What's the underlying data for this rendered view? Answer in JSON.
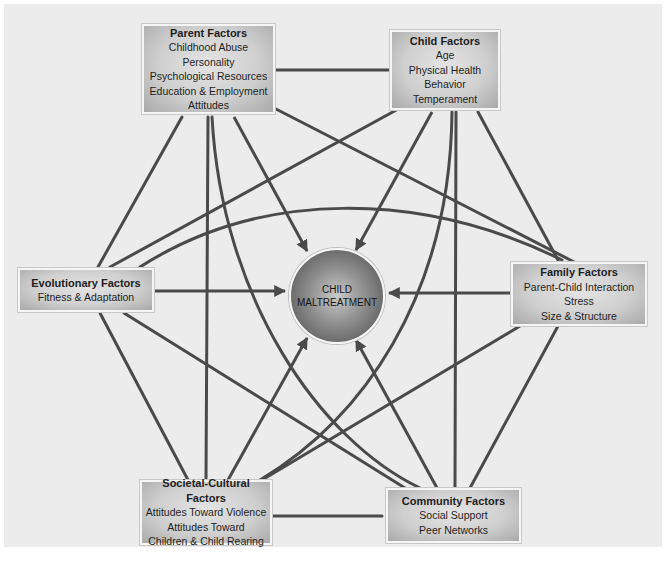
{
  "diagram": {
    "center": {
      "line1": "CHILD",
      "line2": "MALTREATMENT"
    },
    "nodes": {
      "parent": {
        "title": "Parent Factors",
        "items": [
          "Childhood Abuse",
          "Personality",
          "Psychological Resources",
          "Education & Employment",
          "Attitudes"
        ]
      },
      "child": {
        "title": "Child Factors",
        "items": [
          "Age",
          "Physical Health",
          "Behavior",
          "Temperament"
        ]
      },
      "evolutionary": {
        "title": "Evolutionary Factors",
        "items": [
          "Fitness & Adaptation"
        ]
      },
      "family": {
        "title": "Family Factors",
        "items": [
          "Parent-Child Interaction",
          "Stress",
          "Size & Structure"
        ]
      },
      "societal": {
        "title": "Societal-Cultural Factors",
        "items": [
          "Attitudes Toward Violence",
          "Attitudes Toward",
          "Children & Child Rearing"
        ]
      },
      "community": {
        "title": "Community Factors",
        "items": [
          "Social Support",
          "Peer Networks"
        ]
      }
    },
    "colors": {
      "line": "#4a4a4a",
      "background": "#ececec",
      "box": "#cfcfcf",
      "sphere": "#7a7a7a"
    }
  }
}
